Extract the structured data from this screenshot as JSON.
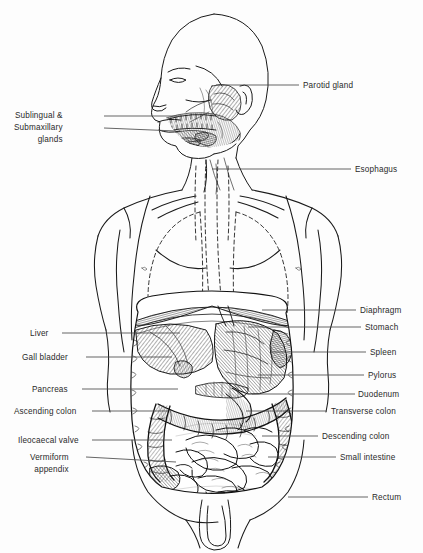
{
  "diagram": {
    "style": "engraved black-and-white line art with cross-hatching, dashed outlines for thoracic structures",
    "background_color": "#fdfdfd",
    "ink_color": "#1a1a1a",
    "label_color": "#2a2a2a",
    "leader_color": "#4a4a4a"
  },
  "labels_left": [
    {
      "id": "sublingual-submaxillary-glands",
      "lines": [
        "Sublingual &",
        "Submaxillary",
        "glands"
      ],
      "text_x": 14,
      "text_y": 110,
      "leader": {
        "x1": 104,
        "y1": 116,
        "x2": 182,
        "y2": 116,
        "x3": 104,
        "y3": 128,
        "x4": 176,
        "y4": 131
      }
    },
    {
      "id": "liver",
      "lines": [
        "Liver"
      ],
      "text_x": 30,
      "text_y": 328,
      "leader": {
        "x1": 62,
        "y1": 333,
        "x2": 180,
        "y2": 333
      }
    },
    {
      "id": "gall-bladder",
      "lines": [
        "Gall bladder"
      ],
      "text_x": 22,
      "text_y": 352,
      "leader": {
        "x1": 86,
        "y1": 357,
        "x2": 172,
        "y2": 357
      }
    },
    {
      "id": "pancreas",
      "lines": [
        "Pancreas"
      ],
      "text_x": 32,
      "text_y": 384,
      "leader": {
        "x1": 82,
        "y1": 389,
        "x2": 178,
        "y2": 389
      }
    },
    {
      "id": "ascending-colon",
      "lines": [
        "Ascending colon"
      ],
      "text_x": 14,
      "text_y": 406,
      "leader": {
        "x1": 92,
        "y1": 411,
        "x2": 168,
        "y2": 411
      }
    },
    {
      "id": "ileocaecal-valve",
      "lines": [
        "Ileocaecal valve"
      ],
      "text_x": 18,
      "text_y": 435,
      "leader": {
        "x1": 92,
        "y1": 440,
        "x2": 172,
        "y2": 440
      }
    },
    {
      "id": "vermiform-appendix",
      "lines": [
        "Vermiform",
        "appendix"
      ],
      "text_x": 30,
      "text_y": 452,
      "leader": {
        "x1": 86,
        "y1": 457,
        "x2": 176,
        "y2": 462
      }
    }
  ],
  "labels_right": [
    {
      "id": "parotid-gland",
      "lines": [
        "Parotid gland"
      ],
      "text_x": 303,
      "text_y": 80,
      "leader": {
        "x1": 216,
        "y1": 85,
        "x2": 299,
        "y2": 85
      }
    },
    {
      "id": "esophagus",
      "lines": [
        "Esophagus"
      ],
      "text_x": 355,
      "text_y": 164,
      "leader": {
        "x1": 212,
        "y1": 169,
        "x2": 351,
        "y2": 169
      }
    },
    {
      "id": "diaphragm",
      "lines": [
        "Diaphragm"
      ],
      "text_x": 360,
      "text_y": 305,
      "leader": {
        "x1": 262,
        "y1": 310,
        "x2": 356,
        "y2": 310
      }
    },
    {
      "id": "stomach",
      "lines": [
        "Stomach"
      ],
      "text_x": 365,
      "text_y": 322,
      "leader": {
        "x1": 248,
        "y1": 327,
        "x2": 361,
        "y2": 327
      }
    },
    {
      "id": "spleen",
      "lines": [
        "Spleen"
      ],
      "text_x": 370,
      "text_y": 347,
      "leader": {
        "x1": 272,
        "y1": 352,
        "x2": 366,
        "y2": 352
      }
    },
    {
      "id": "pylorus",
      "lines": [
        "Pylorus"
      ],
      "text_x": 368,
      "text_y": 370,
      "leader": {
        "x1": 258,
        "y1": 375,
        "x2": 364,
        "y2": 375
      }
    },
    {
      "id": "duodenum",
      "lines": [
        "Duodenum"
      ],
      "text_x": 358,
      "text_y": 389,
      "leader": {
        "x1": 252,
        "y1": 394,
        "x2": 355,
        "y2": 394
      }
    },
    {
      "id": "transverse-colon",
      "lines": [
        "Transverse colon"
      ],
      "text_x": 331,
      "text_y": 406,
      "leader": {
        "x1": 246,
        "y1": 411,
        "x2": 327,
        "y2": 411
      }
    },
    {
      "id": "descending-colon",
      "lines": [
        "Descending colon"
      ],
      "text_x": 322,
      "text_y": 431,
      "leader": {
        "x1": 262,
        "y1": 436,
        "x2": 318,
        "y2": 436
      }
    },
    {
      "id": "small-intestine",
      "lines": [
        "Small intestine"
      ],
      "text_x": 340,
      "text_y": 452,
      "leader": {
        "x1": 268,
        "y1": 457,
        "x2": 336,
        "y2": 457
      }
    },
    {
      "id": "rectum",
      "lines": [
        "Rectum"
      ],
      "text_x": 372,
      "text_y": 492,
      "leader": {
        "x1": 288,
        "y1": 497,
        "x2": 368,
        "y2": 497
      }
    }
  ]
}
